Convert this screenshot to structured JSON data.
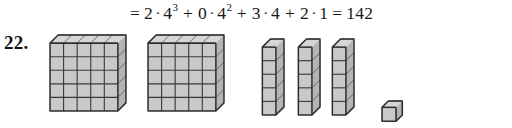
{
  "page": {
    "background_color": "#ffffff",
    "problem_number": "22."
  },
  "equation": {
    "text": "= 2·4³ + 0·4² + 3·4 + 2·1 = 142",
    "leading_equals": "=",
    "terms": [
      {
        "coefficient": "2",
        "dot": "·",
        "base": "4",
        "exponent": "3"
      },
      {
        "coefficient": "0",
        "dot": "·",
        "base": "4",
        "exponent": "2"
      },
      {
        "coefficient": "3",
        "dot": "·",
        "base": "4",
        "exponent": ""
      },
      {
        "coefficient": "2",
        "dot": "·",
        "base": "1",
        "exponent": ""
      }
    ],
    "plus": "+",
    "final_equals": "=",
    "result": "142"
  },
  "figure": {
    "colors": {
      "front_face": "#c9c9c9",
      "top_face": "#d6d6d6",
      "side_face": "#b4b4b4",
      "edge": "#2e2e2e"
    },
    "groups": [
      {
        "name": "cube-block-1",
        "label": "4³ block",
        "cols": 5,
        "rows": 5,
        "left": 49,
        "top": 34,
        "cell": 13.4,
        "skew": 8
      },
      {
        "name": "cube-block-2",
        "label": "4³ block",
        "cols": 5,
        "rows": 5,
        "left": 147,
        "top": 34,
        "cell": 13.4,
        "skew": 8
      },
      {
        "name": "column-block-1",
        "label": "4¹ column",
        "cols": 1,
        "rows": 5,
        "left": 261,
        "top": 38,
        "cell": 13.4,
        "skew": 8
      },
      {
        "name": "column-block-2",
        "label": "4¹ column",
        "cols": 1,
        "rows": 5,
        "left": 297,
        "top": 38,
        "cell": 13.4,
        "skew": 8
      },
      {
        "name": "column-block-3",
        "label": "4¹ column",
        "cols": 1,
        "rows": 5,
        "left": 331,
        "top": 38,
        "cell": 13.4,
        "skew": 8
      },
      {
        "name": "unit-cube",
        "label": "unit cube",
        "cols": 1,
        "rows": 1,
        "left": 381,
        "top": 100,
        "cell": 13.4,
        "skew": 6
      }
    ]
  }
}
